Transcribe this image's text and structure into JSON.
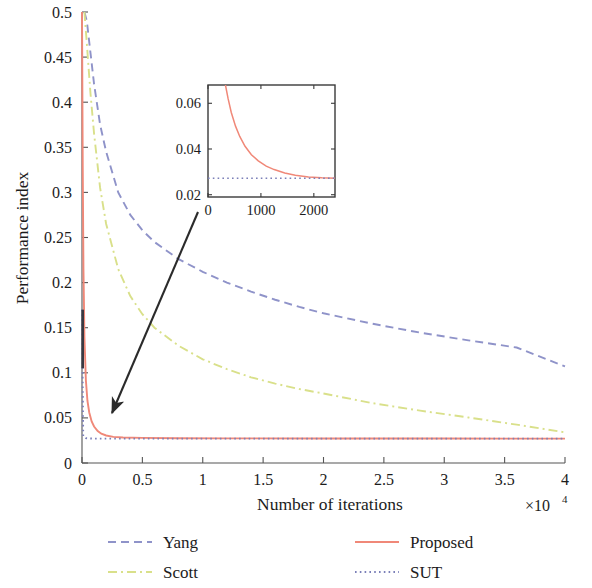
{
  "chart_data": {
    "type": "line",
    "title": "",
    "xlabel": "Number of iterations",
    "ylabel": "Performance index",
    "x_multiplier": "×10",
    "x_multiplier_exp": "4",
    "xlim": [
      0,
      40000
    ],
    "ylim": [
      0,
      0.5
    ],
    "grid": false,
    "legend_position": "bottom",
    "xticks": [
      0,
      5000,
      10000,
      15000,
      20000,
      25000,
      30000,
      35000,
      40000
    ],
    "xticklabels": [
      "0",
      "0.5",
      "1",
      "1.5",
      "2",
      "2.5",
      "3",
      "3.5",
      "4"
    ],
    "yticks": [
      0,
      0.05,
      0.1,
      0.15,
      0.2,
      0.25,
      0.3,
      0.35,
      0.4,
      0.45,
      0.5
    ],
    "yticklabels": [
      "0",
      "0.05",
      "0.1",
      "0.15",
      "0.2",
      "0.25",
      "0.3",
      "0.35",
      "0.4",
      "0.45",
      "0.5"
    ],
    "series": [
      {
        "name": "Yang",
        "color": "#8f93c9",
        "style": "dashed",
        "x": [
          200,
          400,
          700,
          1000,
          1500,
          2000,
          3000,
          4000,
          5000,
          6000,
          8000,
          10000,
          12000,
          14000,
          16000,
          18000,
          20000,
          24000,
          28000,
          32000,
          36000,
          40000
        ],
        "y": [
          0.5,
          0.49,
          0.455,
          0.42,
          0.375,
          0.345,
          0.3,
          0.275,
          0.258,
          0.245,
          0.226,
          0.212,
          0.2,
          0.19,
          0.181,
          0.173,
          0.166,
          0.1545,
          0.1445,
          0.136,
          0.128,
          0.107
        ]
      },
      {
        "name": "Scott",
        "color": "#d9e08a",
        "style": "dashdot",
        "x": [
          200,
          400,
          700,
          1000,
          1500,
          2000,
          3000,
          4000,
          5000,
          6000,
          8000,
          10000,
          12000,
          14000,
          16000,
          18000,
          20000,
          24000,
          28000,
          32000,
          36000,
          40000
        ],
        "y": [
          0.5,
          0.465,
          0.41,
          0.365,
          0.305,
          0.265,
          0.215,
          0.185,
          0.165,
          0.15,
          0.13,
          0.115,
          0.104,
          0.095,
          0.088,
          0.082,
          0.077,
          0.0665,
          0.058,
          0.0505,
          0.0425,
          0.034
        ]
      },
      {
        "name": "Proposed",
        "color": "#f08878",
        "style": "solid",
        "x": [
          0,
          60,
          120,
          200,
          320,
          450,
          600,
          800,
          1000,
          1300,
          1600,
          2000,
          2600,
          3400,
          5000,
          8000,
          12000,
          20000,
          30000,
          40000
        ],
        "y": [
          0.5,
          0.33,
          0.215,
          0.14,
          0.092,
          0.069,
          0.056,
          0.046,
          0.0405,
          0.0355,
          0.0325,
          0.0305,
          0.029,
          0.0283,
          0.0278,
          0.0275,
          0.0273,
          0.0272,
          0.0271,
          0.027
        ]
      },
      {
        "name": "SUT",
        "color": "#7b7fb8",
        "style": "dotted",
        "x": [
          0,
          100,
          300,
          600,
          1000,
          2000,
          5000,
          10000,
          20000,
          30000,
          40000
        ],
        "y": [
          0.17,
          0.0295,
          0.0275,
          0.0272,
          0.027,
          0.027,
          0.027,
          0.027,
          0.027,
          0.027,
          0.027
        ]
      }
    ],
    "inset": {
      "xlim": [
        0,
        2400
      ],
      "ylim": [
        0.019,
        0.068
      ],
      "xticks": [
        0,
        1000,
        2000
      ],
      "xticklabels": [
        "0",
        "1000",
        "2000"
      ],
      "yticks": [
        0.02,
        0.04,
        0.06
      ],
      "yticklabels": [
        "0.02",
        "0.04",
        "0.06"
      ],
      "series": [
        {
          "name": "Proposed",
          "color": "#f08878",
          "style": "solid",
          "x": [
            330,
            380,
            440,
            520,
            600,
            700,
            820,
            950,
            1100,
            1250,
            1450,
            1650,
            1900,
            2150,
            2400
          ],
          "y": [
            0.068,
            0.062,
            0.056,
            0.05,
            0.0455,
            0.0412,
            0.0375,
            0.0348,
            0.0325,
            0.031,
            0.0295,
            0.0285,
            0.0278,
            0.0274,
            0.0272
          ]
        },
        {
          "name": "SUT",
          "color": "#7b7fb8",
          "style": "dotted",
          "x": [
            0,
            2400
          ],
          "y": [
            0.0272,
            0.0272
          ]
        }
      ]
    },
    "annotation": {
      "type": "arrow",
      "from": [
        198,
        212
      ],
      "to": [
        110,
        416
      ]
    }
  },
  "legend": {
    "entries": [
      {
        "label": "Yang",
        "color": "#8f93c9",
        "style": "dashed"
      },
      {
        "label": "Proposed",
        "color": "#f08878",
        "style": "solid"
      },
      {
        "label": "Scott",
        "color": "#d9e08a",
        "style": "dashdot"
      },
      {
        "label": "SUT",
        "color": "#7b7fb8",
        "style": "dotted"
      }
    ]
  },
  "axes": {
    "y_title": "Performance index",
    "x_title": "Number of iterations"
  }
}
